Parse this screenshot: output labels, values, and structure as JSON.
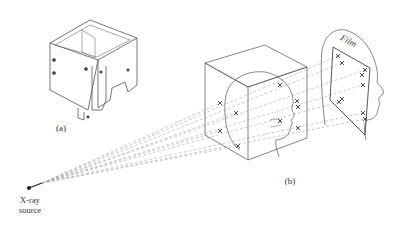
{
  "figure": {
    "panel_a": {
      "label": "(a)",
      "subject": "cube-shaped phantom frame apparatus"
    },
    "panel_b": {
      "label": "(b)",
      "subject": "stereo X-ray projection of head inside calibration cube onto film"
    },
    "source_label_line1": "X-ray",
    "source_label_line2": "source",
    "film_label": "Film"
  },
  "markers": {
    "cube_left_face_count": 4,
    "cube_right_face_count": 5,
    "film_count": 10
  },
  "colors": {
    "line": "#555555",
    "ray": "#aaaaaa",
    "text": "#333333"
  }
}
